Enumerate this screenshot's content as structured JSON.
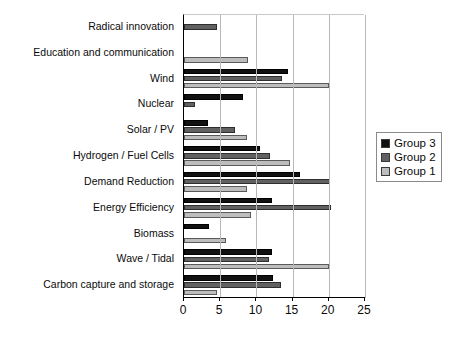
{
  "chart_data": {
    "type": "bar",
    "orientation": "horizontal",
    "title": "",
    "xlabel": "",
    "ylabel": "",
    "xlim": [
      0,
      25
    ],
    "xticks": [
      0,
      5,
      10,
      15,
      20,
      25
    ],
    "grid": true,
    "legend_position": "right",
    "categories": [
      "Radical innovation",
      "Education  and communication",
      "Wind",
      "Nuclear",
      "Solar / PV",
      "Hydrogen / Fuel Cells",
      "Demand Reduction",
      "Energy Efficiency",
      "Biomass",
      "Wave / Tidal",
      "Carbon capture and storage"
    ],
    "series": [
      {
        "name": "Group 3",
        "color": "#111111",
        "values": [
          0,
          0,
          14.4,
          8.2,
          3.3,
          10.5,
          16.0,
          12.2,
          3.5,
          12.2,
          12.3
        ]
      },
      {
        "name": "Group 2",
        "color": "#616161",
        "values": [
          4.5,
          0,
          13.6,
          1.5,
          7.0,
          11.9,
          20.2,
          20.3,
          0,
          11.8,
          13.4
        ]
      },
      {
        "name": "Group 1",
        "color": "#bdbdbd",
        "values": [
          0,
          8.8,
          20.0,
          0,
          8.7,
          14.6,
          8.7,
          9.2,
          5.8,
          20.0,
          4.5
        ]
      }
    ]
  },
  "legend": {
    "items": [
      {
        "label": "Group 3",
        "color": "#111111"
      },
      {
        "label": "Group 2",
        "color": "#616161"
      },
      {
        "label": "Group 1",
        "color": "#bdbdbd"
      }
    ]
  }
}
